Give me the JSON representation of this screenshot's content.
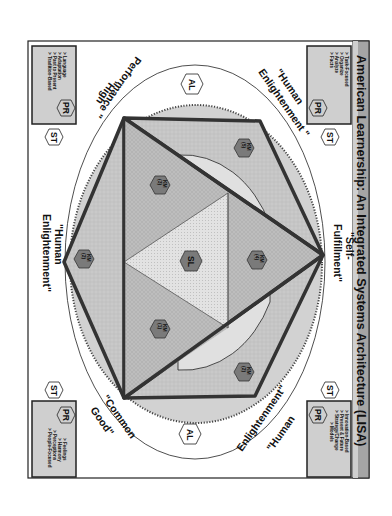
{
  "title": "American Learnership: An Integrated Systems Architecture (LISA)",
  "colors": {
    "frame": "#222222",
    "title_bar": "#9a9a9a",
    "outer_ring": "#d2d2d2",
    "inner_shape": "#bdbdbd",
    "center_triangle": "#e0e0e0",
    "km_hex": "#7a7a7a",
    "box_fill": "#cfcfcf"
  },
  "quadrant_labels": {
    "top_right": "\"Human Enlightenment\"",
    "top_left": "\"High Performance\"",
    "bottom_left": "\"Common Good\"",
    "bottom_right": "\"Human Enlightenment\"",
    "right": "\"Self-Fulfillment\"",
    "left": "\"Human Enlightenment\""
  },
  "split_labels": {
    "right_1": "\"Self-",
    "right_2": "Fulfillment\"",
    "left_1": "\"Human",
    "left_2": "Enlightenment\"",
    "tr_1": "\"Human",
    "tr_2": "Enlightenment \"",
    "tl_1": "\"High",
    "tl_2": "Performance \"",
    "bl_1": "\"Common",
    "bl_2": "Good\"",
    "br_1": "\"Human",
    "br_2": "Enlightenment\""
  },
  "hexagons": {
    "al": "AL",
    "pr": "PR",
    "st": "ST",
    "sl": "SL",
    "km_label": "KM",
    "km_numbers": [
      "(1)",
      "(2)",
      "(3)",
      "(4)",
      "(5)"
    ]
  },
  "corner_boxes": {
    "top_right": [
      "> Task-Focused",
      "> Organize",
      "> Analyze",
      "> Facts"
    ],
    "top_left": [
      "> Language",
      "> Adaptation",
      "> Past to Present",
      "> Tradition-Based"
    ],
    "bottom_left": [
      "> Feelings",
      "> Harmony",
      "> Perceptions",
      "> People-Focused"
    ],
    "bottom_right": [
      "> Innovation-Based",
      "> Present & Future",
      "> Strategy/Change",
      "> Models"
    ]
  }
}
